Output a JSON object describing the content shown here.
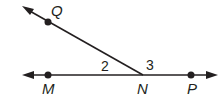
{
  "diagram": {
    "type": "geometry-angles",
    "color": "#231f20",
    "points": {
      "Q": "Q",
      "M": "M",
      "N": "N",
      "P": "P"
    },
    "angles": {
      "angle2": "2",
      "angle3": "3"
    }
  }
}
